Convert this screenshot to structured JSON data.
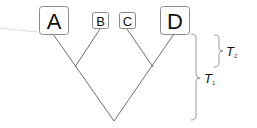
{
  "diagram": {
    "type": "phylogenetic-tree",
    "leaves": [
      {
        "label": "A",
        "size": "large"
      },
      {
        "label": "B",
        "size": "small"
      },
      {
        "label": "C",
        "size": "small"
      },
      {
        "label": "D",
        "size": "large"
      }
    ],
    "internal_nodes": [
      {
        "name": "AB",
        "children": [
          "A",
          "B"
        ]
      },
      {
        "name": "CD",
        "children": [
          "C",
          "D"
        ]
      },
      {
        "name": "root",
        "children": [
          "AB",
          "CD"
        ]
      }
    ],
    "braces": [
      {
        "label": "T",
        "subscript": "2",
        "spans": "leaf tips to inner nodes"
      },
      {
        "label": "T",
        "subscript": "1",
        "spans": "leaf tips to root"
      }
    ],
    "colors": {
      "branch": "#6e6e6e",
      "box_border": "#8a8a8a",
      "brace": "#9a9a9a",
      "text": "#111111"
    }
  }
}
